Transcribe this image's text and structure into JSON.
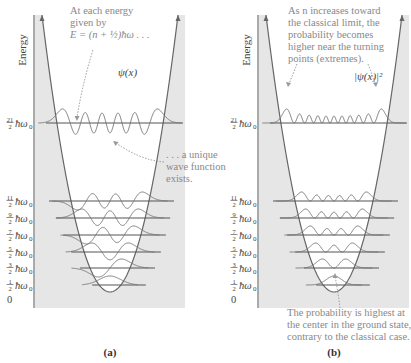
{
  "panels": [
    {
      "id": "a",
      "caption": "(a)",
      "axis_label": "Energy",
      "curve_label": "ψ(x)",
      "note_top": [
        "At each energy",
        "given by",
        "E = (n + ½)ħω . . ."
      ],
      "note_side": [
        ". . . a unique",
        "wave function",
        "exists."
      ],
      "levels": [
        {
          "label": "21/2 ħω₀",
          "num": "21",
          "den": "2"
        },
        {
          "label": "11/2 ħω₀",
          "num": "11",
          "den": "2"
        },
        {
          "label": "9/2 ħω₀",
          "num": "9",
          "den": "2"
        },
        {
          "label": "7/2 ħω₀",
          "num": "7",
          "den": "2"
        },
        {
          "label": "5/2 ħω₀",
          "num": "5",
          "den": "2"
        },
        {
          "label": "3/2 ħω₀",
          "num": "3",
          "den": "2"
        },
        {
          "label": "1/2 ħω₀",
          "num": "1",
          "den": "2"
        }
      ],
      "zero_label": "0"
    },
    {
      "id": "b",
      "caption": "(b)",
      "axis_label": "Energy",
      "curve_label": "|ψ(x)|²",
      "note_top": [
        "As n increases toward",
        "the classical limit, the",
        "probability becomes",
        "higher near the turning",
        "points (extremes)."
      ],
      "note_bottom": [
        "The probability is highest at",
        "the center in the ground state,",
        "contrary to the classical case."
      ],
      "levels": [
        {
          "label": "21/2 ħω₀",
          "num": "21",
          "den": "2"
        },
        {
          "label": "11/2 ħω₀",
          "num": "11",
          "den": "2"
        },
        {
          "label": "9/2 ħω₀",
          "num": "9",
          "den": "2"
        },
        {
          "label": "7/2 ħω₀",
          "num": "7",
          "den": "2"
        },
        {
          "label": "5/2 ħω₀",
          "num": "5",
          "den": "2"
        },
        {
          "label": "3/2 ħω₀",
          "num": "3",
          "den": "2"
        },
        {
          "label": "1/2 ħω₀",
          "num": "1",
          "den": "2"
        }
      ],
      "zero_label": "0"
    }
  ],
  "colors": {
    "shade": "#e6e6e6",
    "curve": "#666666",
    "level": "#555555",
    "note": "#888888"
  }
}
